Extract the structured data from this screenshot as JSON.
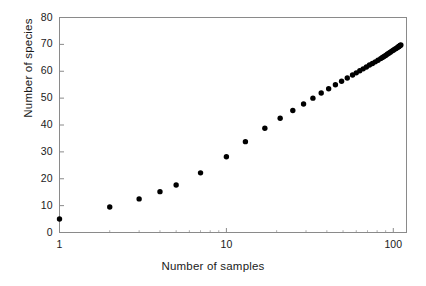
{
  "chart_data": {
    "type": "scatter",
    "title": "",
    "xlabel": "Number of samples",
    "ylabel": "Number of species",
    "xscale": "log",
    "yscale": "linear",
    "xlim": [
      1,
      120
    ],
    "ylim": [
      0,
      80
    ],
    "xticks": [
      1,
      10,
      100
    ],
    "xtick_labels": [
      "1",
      "10",
      "100"
    ],
    "yticks": [
      0,
      10,
      20,
      30,
      40,
      50,
      60,
      70,
      80
    ],
    "ytick_labels": [
      "0",
      "10",
      "20",
      "30",
      "40",
      "50",
      "60",
      "70",
      "80"
    ],
    "grid": false,
    "legend": null,
    "marker": "filled-circle",
    "marker_color": "#000000",
    "marker_size": 5.2,
    "series": [
      {
        "name": "species accumulation",
        "x": [
          1,
          2,
          3,
          4,
          5,
          7,
          10,
          13,
          17,
          21,
          25,
          29,
          33,
          37,
          41,
          45,
          49,
          53,
          57,
          60,
          63,
          66,
          69,
          72,
          75,
          78,
          81,
          84,
          86,
          88,
          90,
          92,
          94,
          96,
          98,
          100,
          102,
          104,
          106,
          107,
          108,
          109,
          110,
          111
        ],
        "y": [
          5,
          9.5,
          12.5,
          15.2,
          17.7,
          22.2,
          28.2,
          33.8,
          38.8,
          42.5,
          45.4,
          47.8,
          50.0,
          51.9,
          53.5,
          55.0,
          56.3,
          57.5,
          58.6,
          59.4,
          60.2,
          60.9,
          61.6,
          62.3,
          62.9,
          63.5,
          64.1,
          64.7,
          65.1,
          65.5,
          65.9,
          66.3,
          66.7,
          67.1,
          67.5,
          67.8,
          68.2,
          68.5,
          68.9,
          69.0,
          69.2,
          69.4,
          69.6,
          69.8
        ]
      }
    ]
  },
  "axes": {
    "ylabel_text": "Number of species",
    "xlabel_text": "Number of samples"
  }
}
